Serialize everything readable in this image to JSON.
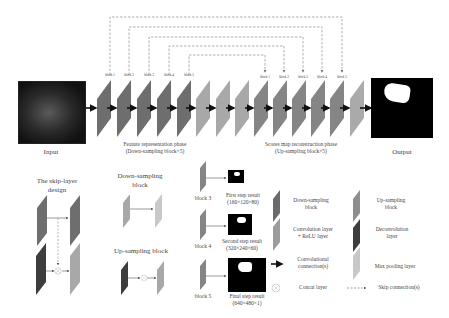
{
  "main": {
    "input_label": "Input",
    "output_label": "Output",
    "down_phase_label": [
      "Feature representation phase",
      "(Down-sampling block×5)"
    ],
    "up_phase_label": [
      "Scores map reconstruction phase",
      "(Up-sampling block×5)"
    ],
    "down_block_labels": [
      "block 1",
      "block 2",
      "block 3",
      "block 4",
      "block 5"
    ],
    "up_block_labels": [
      "block 1",
      "block 2",
      "block 3",
      "block 4",
      "block 5"
    ]
  },
  "skip_design": {
    "title": [
      "The skip-layer",
      "design"
    ]
  },
  "down_block": {
    "title": [
      "Down-sampling",
      "block"
    ]
  },
  "up_block": {
    "title": "Up-sampling block"
  },
  "steps": [
    {
      "block": "block 3",
      "title": "First step result",
      "dims": "(160×120×80)"
    },
    {
      "block": "block 4",
      "title": "Second step result",
      "dims": "(320×240×60)"
    },
    {
      "block": "block 5",
      "title": "Final step result",
      "dims": "(640×480×1)"
    }
  ],
  "legend": {
    "items": [
      {
        "label": [
          "Down-sampling",
          "block"
        ],
        "icon": "dark-gray-block",
        "color": "#6b6b6b"
      },
      {
        "label": [
          "Up-sampling",
          "block"
        ],
        "icon": "mid-gray-block",
        "color": "#8e8e8e"
      },
      {
        "label": [
          "Convolution layer",
          "+ ReLU layer"
        ],
        "icon": "light-gray-block",
        "color": "#9c9c9c"
      },
      {
        "label": [
          "Deconvolution",
          "layer"
        ],
        "icon": "darkest-block",
        "color": "#3d3d3d"
      },
      {
        "label": [
          "Convolutional",
          "connection(s)"
        ],
        "icon": "arrow-icon"
      },
      {
        "label": [
          "Max pooling layer"
        ],
        "icon": "pale-block",
        "color": "#c8c8c8"
      },
      {
        "label": [
          "Concat layer"
        ],
        "icon": "concat-icon"
      },
      {
        "label": [
          "Skip connection(s)"
        ],
        "icon": "dashed-arrow-icon"
      }
    ]
  },
  "colors": {
    "down_block": "#6e6e6e",
    "mid_block": "#a8a8a8",
    "up_block": "#858585",
    "dashed_line": "#9a9a9a",
    "arrow": "#111111"
  }
}
